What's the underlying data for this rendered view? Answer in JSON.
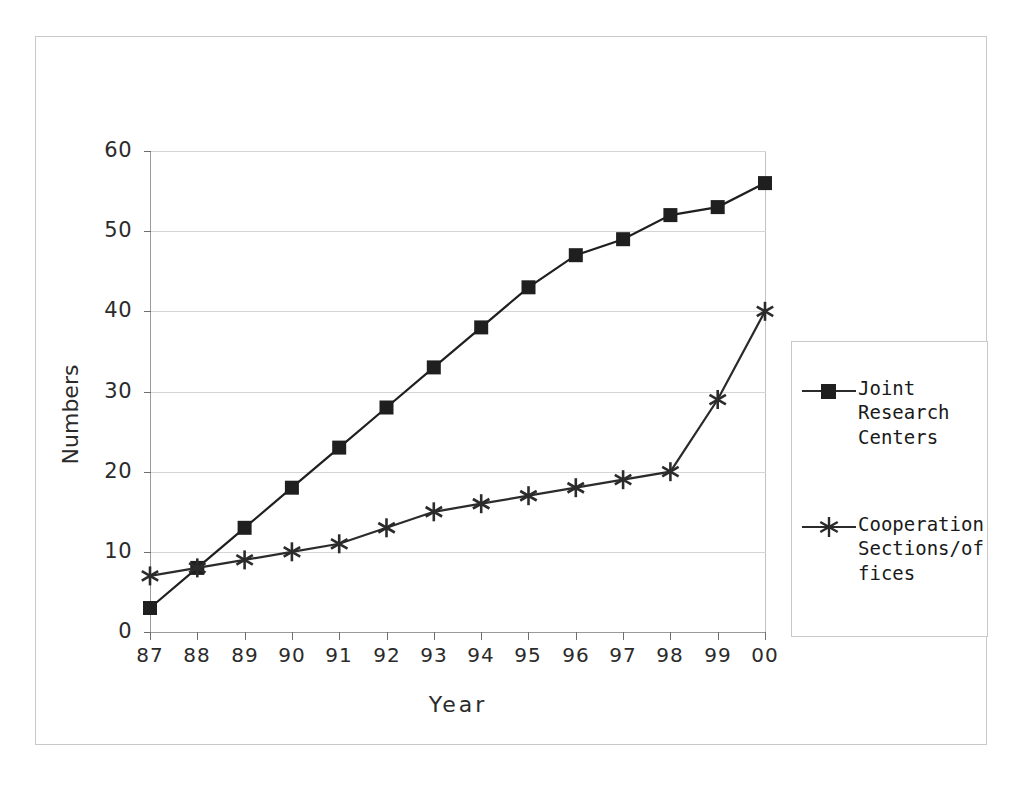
{
  "chart_data": {
    "type": "line",
    "title": "",
    "xlabel": "Year",
    "ylabel": "Numbers",
    "categories": [
      "87",
      "88",
      "89",
      "90",
      "91",
      "92",
      "93",
      "94",
      "95",
      "96",
      "97",
      "98",
      "99",
      "00"
    ],
    "ylim": [
      0,
      60
    ],
    "ytick_values": [
      0,
      10,
      20,
      30,
      40,
      50,
      60
    ],
    "ytick_labels": [
      "0",
      "10",
      "20",
      "30",
      "40",
      "50",
      "60"
    ],
    "grid": true,
    "legend_position": "right",
    "series": [
      {
        "name": "Joint Research Centers",
        "marker": "square",
        "color": "#1f1f1f",
        "values": [
          3,
          8,
          13,
          18,
          23,
          28,
          33,
          38,
          43,
          47,
          49,
          52,
          53,
          56
        ]
      },
      {
        "name": "Cooperation Sections/offices",
        "marker": "asterisk",
        "color": "#2b2b2b",
        "values": [
          7,
          8,
          9,
          10,
          11,
          13,
          15,
          16,
          17,
          18,
          19,
          20,
          29,
          40
        ]
      }
    ]
  },
  "legend": {
    "entries": [
      {
        "label": "Joint\nResearch\nCenters",
        "marker": "square"
      },
      {
        "label": "Cooperation\nSections/of\nfices",
        "marker": "asterisk"
      }
    ]
  },
  "axis": {
    "y_label": "Numbers",
    "x_label": "Year"
  }
}
